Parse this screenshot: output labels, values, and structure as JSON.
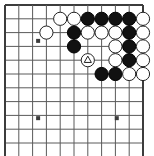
{
  "diagram": {
    "kind": "go-board-diagram",
    "board": {
      "visible_columns": 11,
      "visible_rows": 11,
      "origin_x": 5,
      "origin_y": 5,
      "cell": 13.8,
      "line_color": "#5a5a5a",
      "edge_color": "#3c3c3c",
      "line_width": 1,
      "edge_width": 2,
      "background": "#ffffff",
      "edges": {
        "top": true,
        "left": true,
        "right": true,
        "bottom": false
      }
    },
    "star_points": [
      {
        "col": 2.4,
        "row": 2.6
      },
      {
        "col": 2.4,
        "row": 8.2
      },
      {
        "col": 8.1,
        "row": 8.2
      }
    ],
    "stone_radius": 6.6,
    "colors": {
      "black_fill": "#111111",
      "black_edge": "#000000",
      "white_fill": "#ffffff",
      "white_edge": "#222222",
      "mark_color": "#222222"
    },
    "stones": [
      {
        "col": 4,
        "row": 1,
        "color": "white",
        "mark": ""
      },
      {
        "col": 5,
        "row": 1,
        "color": "white",
        "mark": ""
      },
      {
        "col": 6,
        "row": 1,
        "color": "black",
        "mark": ""
      },
      {
        "col": 7,
        "row": 1,
        "color": "black",
        "mark": ""
      },
      {
        "col": 8,
        "row": 1,
        "color": "black",
        "mark": ""
      },
      {
        "col": 9,
        "row": 1,
        "color": "black",
        "mark": ""
      },
      {
        "col": 10,
        "row": 1,
        "color": "white",
        "mark": ""
      },
      {
        "col": 3,
        "row": 2,
        "color": "white",
        "mark": ""
      },
      {
        "col": 5,
        "row": 2,
        "color": "black",
        "mark": ""
      },
      {
        "col": 6,
        "row": 2,
        "color": "white",
        "mark": ""
      },
      {
        "col": 7,
        "row": 2,
        "color": "white",
        "mark": ""
      },
      {
        "col": 8,
        "row": 2,
        "color": "white",
        "mark": ""
      },
      {
        "col": 9,
        "row": 2,
        "color": "black",
        "mark": ""
      },
      {
        "col": 10,
        "row": 2,
        "color": "white",
        "mark": ""
      },
      {
        "col": 5,
        "row": 3,
        "color": "black",
        "mark": ""
      },
      {
        "col": 8,
        "row": 3,
        "color": "white",
        "mark": ""
      },
      {
        "col": 9,
        "row": 3,
        "color": "black",
        "mark": ""
      },
      {
        "col": 10,
        "row": 3,
        "color": "white",
        "mark": ""
      },
      {
        "col": 6,
        "row": 4,
        "color": "white",
        "mark": "triangle"
      },
      {
        "col": 8,
        "row": 4,
        "color": "white",
        "mark": ""
      },
      {
        "col": 9,
        "row": 4,
        "color": "black",
        "mark": ""
      },
      {
        "col": 10,
        "row": 4,
        "color": "white",
        "mark": ""
      },
      {
        "col": 7,
        "row": 5,
        "color": "black",
        "mark": ""
      },
      {
        "col": 8,
        "row": 5,
        "color": "black",
        "mark": ""
      },
      {
        "col": 9,
        "row": 5,
        "color": "white",
        "mark": ""
      },
      {
        "col": 10,
        "row": 5,
        "color": "white",
        "mark": ""
      }
    ]
  }
}
